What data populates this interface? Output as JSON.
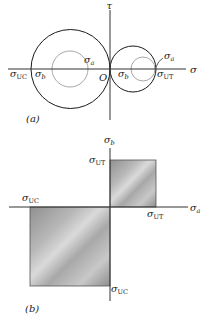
{
  "figure_a": {
    "caption": "(a)",
    "axis_labels": {
      "sigma": "σ",
      "tau": "τ",
      "origin": "O"
    },
    "labels": {
      "sigma_uc_main": "σ",
      "sigma_uc_sub": "UC",
      "sigma_b_left_main": "σ",
      "sigma_b_left_sub": "b",
      "sigma_a_left_main": "σ",
      "sigma_a_left_sub": "a",
      "sigma_b_right_main": "σ",
      "sigma_b_right_sub": "b",
      "sigma_ut_main": "σ",
      "sigma_ut_sub": "UT",
      "sigma_a_right_main": "σ",
      "sigma_a_right_sub": "a"
    },
    "colors": {
      "black_circles": "#1a1a1a",
      "gray_circles": "#a8a8a8",
      "axes": "#333333"
    }
  },
  "figure_b": {
    "caption": "(b)",
    "axis_labels": {
      "vertical_main": "σ",
      "vertical_sub": "b",
      "horizontal_main": "σ",
      "horizontal_sub": "a"
    },
    "labels": {
      "top_ut_main": "σ",
      "top_ut_sub": "UT",
      "left_uc_main": "σ",
      "left_uc_sub": "UC",
      "right_ut_main": "σ",
      "right_ut_sub": "UT",
      "bottom_uc_main": "σ",
      "bottom_uc_sub": "UC"
    },
    "colors": {
      "fill_dark": "#8c8c8c",
      "fill_light": "#d6d6d6",
      "axes": "#333333"
    }
  }
}
